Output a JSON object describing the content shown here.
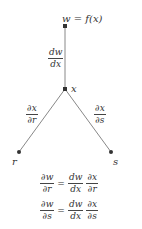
{
  "diagram": {
    "type": "chain-rule-tree",
    "nodes": {
      "top": {
        "label": "w = f(x)"
      },
      "middle": {
        "label": "x"
      },
      "left": {
        "label": "r"
      },
      "right": {
        "label": "s"
      }
    },
    "edges": {
      "top_middle": {
        "num": "dw",
        "den": "dx"
      },
      "middle_left": {
        "num": "∂x",
        "den": "∂r"
      },
      "middle_right": {
        "num": "∂x",
        "den": "∂s"
      }
    },
    "equations": [
      {
        "lhs": {
          "num": "∂w",
          "den": "∂r"
        },
        "op": "=",
        "rhs1": {
          "num": "dw",
          "den": "dx"
        },
        "rhs2": {
          "num": "∂x",
          "den": "∂r"
        }
      },
      {
        "lhs": {
          "num": "∂w",
          "den": "∂s"
        },
        "op": "=",
        "rhs1": {
          "num": "dw",
          "den": "dx"
        },
        "rhs2": {
          "num": "∂x",
          "den": "∂s"
        }
      }
    ],
    "colors": {
      "line": "#777777",
      "node": "#333333",
      "text": "#333333"
    }
  }
}
